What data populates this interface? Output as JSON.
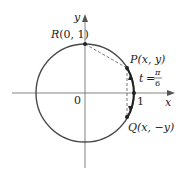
{
  "figure": {
    "axes": {
      "x_label": "x",
      "y_label": "y",
      "origin_label": "0",
      "x_tick_label": "1"
    },
    "circle": {
      "description": "unit circle",
      "color": "#4a4a4a"
    },
    "points": {
      "R": {
        "label_prefix": "R",
        "label_coords": "(0, 1)"
      },
      "P": {
        "label_prefix": "P",
        "label_coords": "(x, y)"
      },
      "Q": {
        "label_prefix": "Q",
        "label_coords": "(x, −y)"
      }
    },
    "angle": {
      "var": "t",
      "equals": "=",
      "numerator": "π",
      "denominator": "6"
    },
    "colors": {
      "line": "#4a4a4a",
      "axis": "#555555",
      "text": "#222222",
      "background": "#ffffff"
    }
  }
}
